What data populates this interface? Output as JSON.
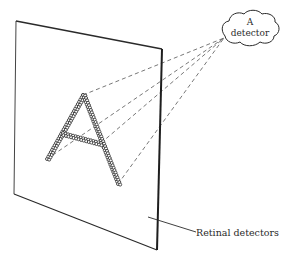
{
  "diagram": {
    "type": "perception-feature-detector",
    "detector_label_line1": "A",
    "detector_label_line2": "detector",
    "retina_label": "Retinal detectors",
    "letter_shown": "A",
    "colors": {
      "ink": "#2a2a2a",
      "background": "#ffffff"
    },
    "nodes": [
      {
        "id": "detector",
        "label": "A detector",
        "shape": "cloud"
      },
      {
        "id": "retina",
        "label": "Retinal detectors",
        "shape": "plane"
      },
      {
        "id": "letter",
        "label": "A",
        "shape": "dotted-letter"
      }
    ],
    "edges": [
      {
        "from": "letter-foot-left",
        "to": "detector",
        "style": "dashed"
      },
      {
        "from": "letter-apex",
        "to": "detector",
        "style": "dashed"
      },
      {
        "from": "letter-crossbar",
        "to": "detector",
        "style": "dashed"
      },
      {
        "from": "letter-foot-right",
        "to": "detector",
        "style": "dashed"
      },
      {
        "from": "retina-label",
        "to": "retina",
        "style": "solid"
      }
    ]
  }
}
